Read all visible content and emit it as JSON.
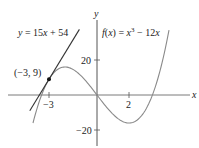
{
  "chart_data": {
    "type": "line",
    "title": "",
    "xlabel": "x",
    "ylabel": "y",
    "x_ticks": [
      {
        "value": -3,
        "label": "−3"
      },
      {
        "value": 2,
        "label": "2"
      }
    ],
    "y_ticks": [
      {
        "value": 20,
        "label": "20"
      },
      {
        "value": -20,
        "label": "−20"
      }
    ],
    "xlim": [
      -5.5,
      5.9
    ],
    "ylim": [
      -28,
      54
    ],
    "grid": false,
    "legend": "none",
    "series": [
      {
        "name": "f(x) = x^3 − 12x",
        "label_parts": {
          "f": "f",
          "open": "(",
          "x": "x",
          "close": ") = ",
          "x2": "x",
          "exp": "3",
          "rest": " − 12",
          "x3": "x"
        },
        "kind": "function",
        "x_range": [
          -4,
          4.5
        ],
        "sample_points": [
          [
            -4,
            -16
          ],
          [
            -3.46,
            0
          ],
          [
            -3,
            9
          ],
          [
            -2,
            16
          ],
          [
            0,
            0
          ],
          [
            2,
            -16
          ],
          [
            3.46,
            0
          ],
          [
            4,
            16
          ],
          [
            4.5,
            37.1
          ]
        ],
        "color": "#8a8a8a"
      },
      {
        "name": "y = 15x + 54",
        "label_parts": {
          "y": "y",
          "eq": " = 15",
          "x": "x",
          "rest": " + 54"
        },
        "kind": "tangent-line",
        "x_range": [
          -4.2,
          -1.1
        ],
        "sample_points": [
          [
            -4.2,
            -9
          ],
          [
            -3,
            9
          ],
          [
            -1.1,
            37.5
          ]
        ],
        "color": "#333333"
      }
    ],
    "annotations": [
      {
        "type": "point",
        "x": -3,
        "y": 9,
        "label": "(−3, 9)",
        "color": "#111111"
      }
    ]
  },
  "labels": {
    "x_axis": "x",
    "y_axis": "y",
    "tick_x_neg3": "−3",
    "tick_x_2": "2",
    "tick_y_20": "20",
    "tick_y_neg20": "−20",
    "point_label": "(−3, 9)",
    "tangent": {
      "y": "y",
      "eq": " = 15",
      "x": "x",
      "rest": " + 54"
    },
    "func": {
      "f": "f",
      "open": "(",
      "x": "x",
      "close": ") = ",
      "x2": "x",
      "exp": "3",
      "rest": " − 12",
      "x3": "x"
    }
  }
}
